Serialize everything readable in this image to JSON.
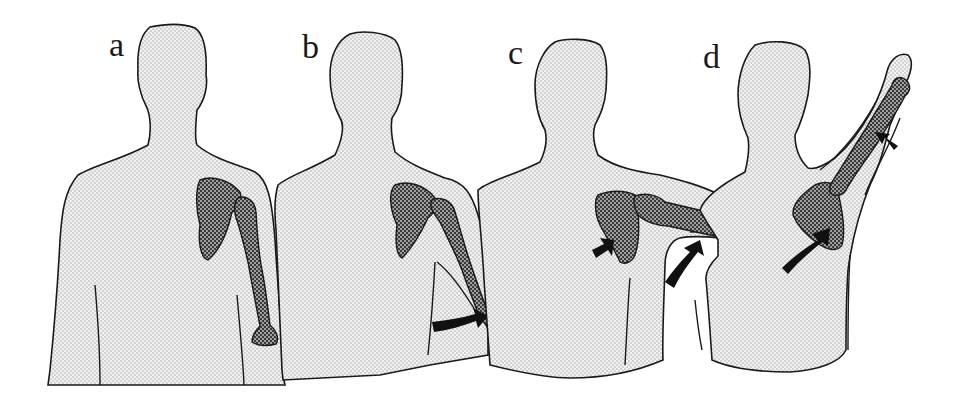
{
  "figure": {
    "colors": {
      "background": "#ffffff",
      "body_fill": "#eeeeee",
      "body_dots": "#9a9a9a",
      "outline": "#1a1a1a",
      "bone_fill": "#4a4a4a",
      "bone_dots": "#cccccc",
      "arrow": "#111111"
    },
    "panels": [
      {
        "label": "a",
        "label_x": 109,
        "label_y": 28,
        "arm_angle_deg": 0,
        "arrows": 0
      },
      {
        "label": "b",
        "label_x": 302,
        "label_y": 30,
        "arm_angle_deg": 20,
        "arrows": 1
      },
      {
        "label": "c",
        "label_x": 508,
        "label_y": 36,
        "arm_angle_deg": 90,
        "arrows": 2
      },
      {
        "label": "d",
        "label_x": 703,
        "label_y": 40,
        "arm_angle_deg": 150,
        "arrows": 2
      }
    ]
  }
}
